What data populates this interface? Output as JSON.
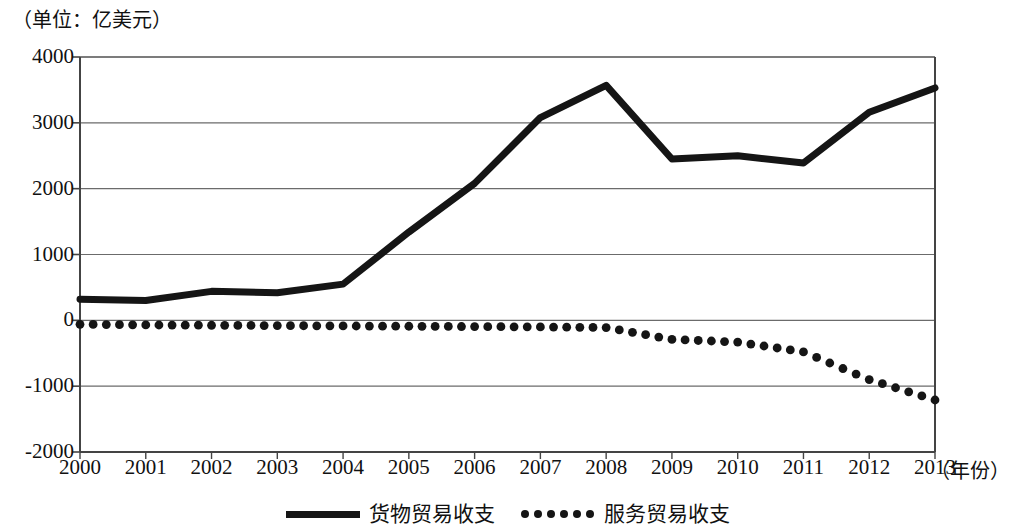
{
  "chart_data": {
    "type": "line",
    "title": "",
    "unit_label": "（单位：亿美元）",
    "xlabel": "（年份）",
    "ylabel": "",
    "grid": true,
    "legend_position": "bottom-center",
    "categories": [
      "2000",
      "2001",
      "2002",
      "2003",
      "2004",
      "2005",
      "2006",
      "2007",
      "2008",
      "2009",
      "2010",
      "2011",
      "2012",
      "2013"
    ],
    "x": [
      2000,
      2001,
      2002,
      2003,
      2004,
      2005,
      2006,
      2007,
      2008,
      2009,
      2010,
      2011,
      2012,
      2013
    ],
    "xlim": [
      2000,
      2013
    ],
    "ylim": [
      -2000,
      4000
    ],
    "yticks": [
      4000,
      3000,
      2000,
      1000,
      0,
      -1000,
      -2000
    ],
    "ytick_labels": [
      "4000",
      "3000",
      "2000",
      "1000",
      "0",
      "-1000",
      "-2000"
    ],
    "series": [
      {
        "name": "货物贸易收支",
        "style": "solid",
        "color": "#151515",
        "values": [
          320,
          300,
          440,
          420,
          550,
          1340,
          2080,
          3080,
          3570,
          2450,
          2500,
          2390,
          3160,
          3530
        ]
      },
      {
        "name": "服务贸易收支",
        "style": "dotted",
        "color": "#151515",
        "values": [
          -60,
          -70,
          -75,
          -80,
          -85,
          -90,
          -95,
          -100,
          -110,
          -290,
          -330,
          -480,
          -900,
          -1210
        ]
      }
    ]
  },
  "legend": {
    "items": [
      {
        "label": "货物贸易收支",
        "marker": "solid-line-marker"
      },
      {
        "label": "服务贸易收支",
        "marker": "dotted-line-marker"
      }
    ]
  }
}
